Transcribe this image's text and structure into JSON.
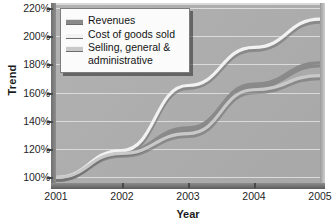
{
  "chart_data": {
    "type": "line",
    "title": "",
    "xlabel": "Year",
    "ylabel": "Trend",
    "x": [
      2001,
      2002,
      2003,
      2004,
      2005
    ],
    "xtick_labels": [
      "2001",
      "2002",
      "2003",
      "2004",
      "2005"
    ],
    "ytick_labels": [
      "100%",
      "120%",
      "140%",
      "160%",
      "180%",
      "200%",
      "220%"
    ],
    "ytick_values": [
      100,
      120,
      140,
      160,
      180,
      200,
      220
    ],
    "ylim": [
      96,
      222
    ],
    "xlim": [
      2001,
      2005
    ],
    "grid": true,
    "legend_position": "top-left",
    "series": [
      {
        "name": "Revenues",
        "color": "#8a8a8a",
        "values": [
          100,
          118,
          135,
          166,
          181
        ]
      },
      {
        "name": "Cost of goods sold",
        "color": "#f2f2f2",
        "values": [
          100,
          119,
          165,
          192,
          212
        ]
      },
      {
        "name": "Selling, general & administrative",
        "color": "#c9c9c9",
        "values": [
          100,
          117,
          131,
          162,
          172
        ]
      }
    ]
  },
  "legend": {
    "items": [
      {
        "label": "Revenues",
        "continuation": ""
      },
      {
        "label": "Cost of goods sold",
        "continuation": ""
      },
      {
        "label": "Selling, general &",
        "continuation": "administrative"
      }
    ]
  },
  "axes": {
    "y_title": "Trend",
    "x_title": "Year"
  },
  "colors": {
    "plot_background": "#adadad",
    "page_background": "#ffffff",
    "gridline": "#e3e3e3",
    "axis": "#5c5c5c",
    "text": "#1a1a1a"
  }
}
